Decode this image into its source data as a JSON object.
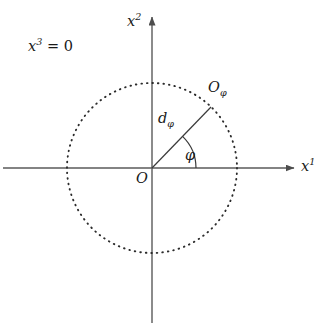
{
  "figure": {
    "background_color": "#ffffff",
    "stroke_color": "#4d4d4d",
    "text_color": "#1a1a1a",
    "width": 325,
    "height": 323
  },
  "labels": {
    "plane_condition": {
      "base": "x",
      "sup": "3",
      "rest": " = 0",
      "full": "x^3 = 0"
    },
    "axis_vertical": {
      "base": "x",
      "sup": "2",
      "full": "x^2"
    },
    "axis_horizontal": {
      "base": "x",
      "sup": "1",
      "full": "x^1"
    },
    "point_on_circle": {
      "base": "O",
      "sub": "φ",
      "full": "O_φ"
    },
    "radius_segment": {
      "base": "d",
      "sub": "φ",
      "full": "d_φ"
    },
    "angle": {
      "base": "φ",
      "full": "φ"
    },
    "origin": {
      "base": "O",
      "full": "O"
    }
  },
  "chart_data": {
    "type": "scatter",
    "title": "",
    "xlabel": "x^1",
    "ylabel": "x^2",
    "annotations": [
      "x^3 = 0",
      "O",
      "O_φ",
      "d_φ",
      "φ"
    ],
    "grid": false,
    "legend": "none",
    "geometry": {
      "origin": {
        "x": 152,
        "y": 168
      },
      "circle": {
        "style": "dotted",
        "center": {
          "x": 152,
          "y": 168
        },
        "radius": 85,
        "dot_count": 96
      },
      "axes": [
        {
          "name": "x^1",
          "direction": "horizontal",
          "from": {
            "x": 3,
            "y": 168
          },
          "to": {
            "x": 295,
            "y": 168
          },
          "arrow_at": "end"
        },
        {
          "name": "x^2",
          "direction": "vertical",
          "from": {
            "x": 152,
            "y": 323
          },
          "to": {
            "x": 152,
            "y": 16
          },
          "arrow_at": "end"
        }
      ],
      "radius_line": {
        "label": "d_φ",
        "from": {
          "x": 152,
          "y": 168
        },
        "to": {
          "x": 211,
          "y": 107
        },
        "angle_degrees": 46
      },
      "angle_arc": {
        "label": "φ",
        "center": {
          "x": 152,
          "y": 168
        },
        "radius": 44,
        "start_degrees": 0,
        "end_degrees": 46
      }
    }
  }
}
